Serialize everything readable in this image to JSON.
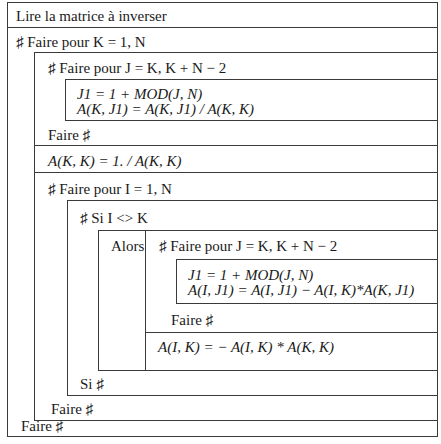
{
  "rows": {
    "read": "Lire la matrice à inverser",
    "loop_k_header": "♯ Faire pour K = 1, N",
    "loop_j1_header": "♯ Faire pour J = K, K + N − 2",
    "loop_j1_body_line1": "J1 = 1 + MOD(J, N)",
    "loop_j1_body_line2": "A(K, J1) = A(K, J1) / A(K, K)",
    "loop_j1_footer": "Faire ♯",
    "diag_assign": "A(K, K) = 1. / A(K, K)",
    "loop_i_header": "♯ Faire pour I = 1, N",
    "if_header": "♯ Si I <> K",
    "then_label": "Alors",
    "loop_j2_header": "♯ Faire pour J = K, K + N − 2",
    "loop_j2_body_line1": "J1 = 1 + MOD(J, N)",
    "loop_j2_body_line2": "A(I, J1) = A(I, J1) − A(I, K)*A(K, J1)",
    "loop_j2_footer": "Faire ♯",
    "col_assign": "A(I, K) = − A(I, K) * A(K, K)",
    "if_footer": "Si ♯",
    "loop_i_footer": "Faire ♯",
    "loop_k_footer": "Faire ♯"
  },
  "colors": {
    "line": "#3a3a3a",
    "text": "#1a1a1a",
    "background": "#ffffff"
  }
}
